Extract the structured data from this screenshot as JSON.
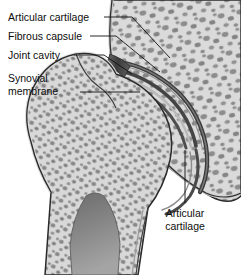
{
  "figure": {
    "background_color": "#ffffff",
    "colors": {
      "bone_fill": "#d6d6d6",
      "bone_fill_light": "#e2e2e2",
      "cortical_outline": "#2b2b2b",
      "trabecula": "#8b8b8b",
      "trabecula_dark": "#6f6f6f",
      "cartilage_dark": "#4a4a4a",
      "capsule_band": "#3a3a3a",
      "joint_cavity": "#9a9a9a",
      "marrow_cavity": "#7d7d7d",
      "leader_line": "#111111",
      "label_text": "#0d0d0d"
    },
    "labels": [
      {
        "id": "articular-cartilage-top",
        "lines": [
          "Articular cartilage"
        ],
        "text_x": 8,
        "text_y": 21,
        "align": "start",
        "leader": "M 104 17 L 132 17 L 170 58"
      },
      {
        "id": "fibrous-capsule",
        "lines": [
          "Fibrous capsule"
        ],
        "text_x": 8,
        "text_y": 40,
        "align": "start",
        "leader": "M 90 36 L 116 36 L 160 72"
      },
      {
        "id": "joint-cavity",
        "lines": [
          "Joint cavity"
        ],
        "text_x": 8,
        "text_y": 59,
        "align": "start",
        "leader": "M 74 55 L 104 55 L 132 74"
      },
      {
        "id": "synovial-membrane",
        "lines": [
          "Synovial",
          "membrane"
        ],
        "text_x": 8,
        "text_y": 82,
        "line_height": 13,
        "align": "start",
        "leader": "M 80 92 L 140 92"
      },
      {
        "id": "articular-cartilage-bottom",
        "lines": [
          "Articular",
          "cartilage"
        ],
        "text_x": 185,
        "text_y": 217,
        "line_height": 13,
        "align": "middle",
        "leader": "M 185 150 L 185 203"
      }
    ],
    "structures": [
      {
        "name": "ilium-acetabulum",
        "description": "Upper hip bone with acetabular socket and trabecular bone"
      },
      {
        "name": "femoral-head",
        "description": "Ball of the femur seated in the acetabulum"
      },
      {
        "name": "femoral-neck",
        "description": "Narrowed region joining head to shaft"
      },
      {
        "name": "greater-trochanter",
        "description": "Lateral bony prominence of the femur"
      },
      {
        "name": "femoral-shaft",
        "description": "Diaphysis with medullary marrow cavity"
      },
      {
        "name": "joint-capsule",
        "description": "Dark fibrous bands enclosing the joint"
      },
      {
        "name": "articular-cartilage-layer",
        "description": "Dark lining on articulating bone surfaces"
      }
    ]
  }
}
